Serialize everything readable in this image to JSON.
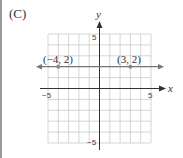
{
  "panel_label": "(C)",
  "axes": {
    "x_label": "x",
    "y_label": "y",
    "x_ticks": {
      "neg": "−5",
      "pos": "5"
    },
    "y_ticks": {
      "pos": "5",
      "neg": "−5"
    },
    "range": [
      -5,
      5
    ]
  },
  "line": {
    "description": "horizontal line y = 2",
    "y": 2
  },
  "points": [
    {
      "label": "(−4, 2)",
      "x": -4,
      "y": 2
    },
    {
      "label": "(3, 2)",
      "x": 3,
      "y": 2
    }
  ],
  "colors": {
    "grid": "#cccccc",
    "axis": "#333333",
    "line": "#777777",
    "point": "#888888"
  }
}
